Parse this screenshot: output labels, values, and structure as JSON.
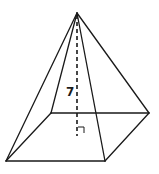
{
  "diagram": {
    "type": "square-pyramid",
    "height_label": "7",
    "right_angle_marker": true,
    "points": {
      "apex": [
        77,
        13
      ],
      "base_front_left": [
        6,
        161
      ],
      "base_front_right": [
        105,
        161
      ],
      "base_back_right": [
        149,
        113
      ],
      "base_back_left": [
        51,
        113
      ],
      "base_center_foot": [
        77,
        136
      ]
    },
    "colors": {
      "stroke": "#1a1a1a",
      "background": "#ffffff"
    }
  }
}
